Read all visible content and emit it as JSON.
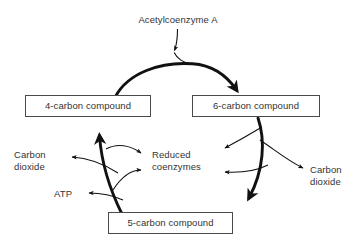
{
  "diagram": {
    "title_text": "Acetylcoenzyme A",
    "background_color": "#ffffff",
    "line_color": "#111111",
    "text_color": "#333333",
    "box_border_color": "#4a4a4a",
    "nodes": {
      "c4": "4-carbon compound",
      "c6": "6-carbon compound",
      "c5": "5-carbon compound"
    },
    "labels": {
      "acetyl_coenzyme_a": "Acetylcoenzyme A",
      "carbon_dioxide_left": "Carbon\ndioxide",
      "carbon_dioxide_right": "Carbon\ndioxide",
      "reduced_coenzymes": "Reduced\ncoenzymes",
      "atp": "ATP"
    },
    "arrows": [
      {
        "name": "acetyl-coa-input",
        "from": "Acetylcoenzyme A",
        "to": "cycle top arc",
        "weight": "thin"
      },
      {
        "name": "c4-to-c6",
        "from": "4-carbon compound",
        "to": "6-carbon compound",
        "weight": "thick"
      },
      {
        "name": "c6-to-c5",
        "from": "6-carbon compound",
        "to": "5-carbon compound",
        "weight": "thick"
      },
      {
        "name": "c5-to-c4",
        "from": "5-carbon compound",
        "to": "4-carbon compound",
        "weight": "thick"
      },
      {
        "name": "c6-to-reduced-coenzymes",
        "from": "6-carbon compound",
        "to": "Reduced coenzymes",
        "weight": "thin"
      },
      {
        "name": "c6-to-carbon-dioxide",
        "from": "6-carbon compound",
        "to": "Carbon dioxide",
        "weight": "thin"
      },
      {
        "name": "c5-to-reduced-coenzymes-upper",
        "from": "5-carbon compound",
        "to": "Reduced coenzymes",
        "weight": "thin"
      },
      {
        "name": "c5-to-reduced-coenzymes-lower",
        "from": "5-carbon compound",
        "to": "Reduced coenzymes",
        "weight": "thin"
      },
      {
        "name": "c5-to-carbon-dioxide",
        "from": "5-carbon compound",
        "to": "Carbon dioxide",
        "weight": "thin"
      },
      {
        "name": "c5-to-atp",
        "from": "5-carbon compound",
        "to": "ATP",
        "weight": "thin"
      }
    ]
  }
}
